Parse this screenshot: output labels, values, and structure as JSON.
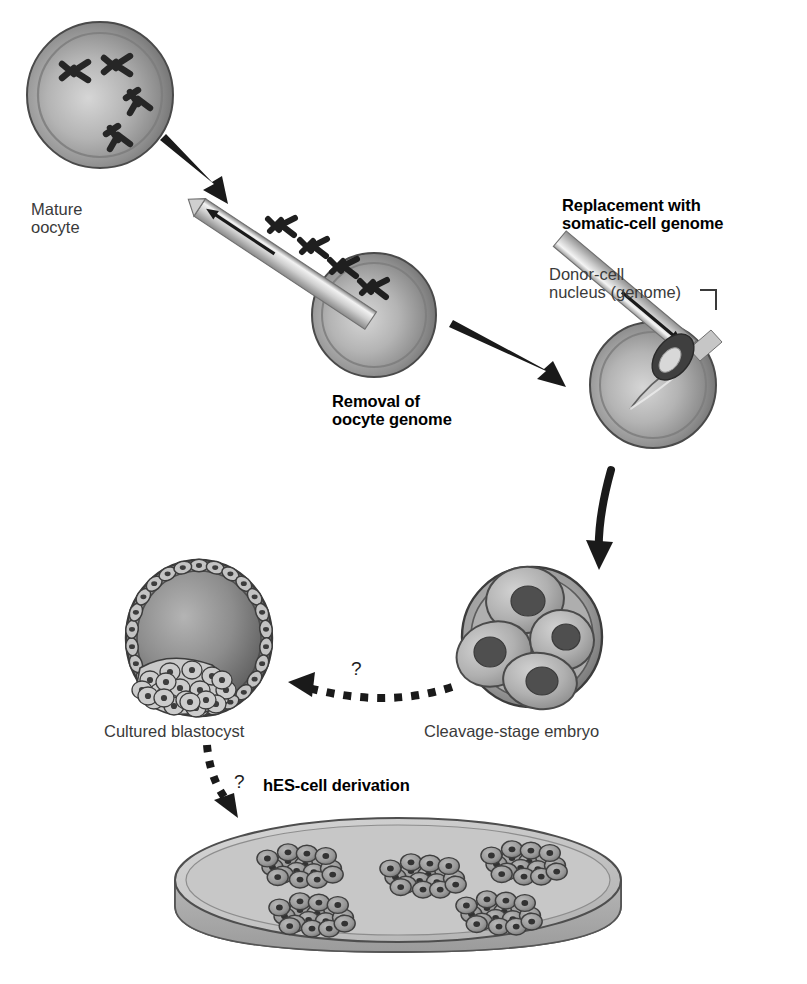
{
  "figure": {
    "type": "scientific-process-diagram",
    "background_color": "#ffffff"
  },
  "palette": {
    "cell_light": "#d8d8d8",
    "cell_mid": "#a9a9a9",
    "cell_dark": "#6f6f6f",
    "outline": "#333333",
    "nucleus_dark": "#4a4a4a",
    "arrow_black": "#1a1a1a",
    "text_gray": "#3a3a3a",
    "text_black": "#000000",
    "dish_fill": "#c9c9c9",
    "dish_rim": "#b2b2b2"
  },
  "labels": {
    "mature_oocyte": "Mature\noocyte",
    "removal_of_oocyte_genome": "Removal of\noocyte genome",
    "replacement_with_somatic_cell_genome": "Replacement with\nsomatic-cell genome",
    "donor_cell_nucleus": "Donor-cell\nnucleus (genome)",
    "cultured_blastocyst": "Cultured blastocyst",
    "cleavage_stage_embryo": "Cleavage-stage embryo",
    "hes_cell_derivation": "hES-cell derivation",
    "question_mark_embryo_to_blastocyst": "?",
    "question_mark_blastocyst_to_dish": "?"
  },
  "stages": [
    {
      "id": "mature-oocyte",
      "name": "Mature oocyte",
      "caption": "Mature\noocyte",
      "caption_bold": false,
      "chromosome_count": 4,
      "cx": 100,
      "cy": 95,
      "r": 73
    },
    {
      "id": "enucleated-oocyte",
      "name": "Oocyte with genome being removed",
      "caption": "Removal of\noocyte genome",
      "caption_bold": true,
      "chromosomes_in_pipette": 4,
      "cx": 374,
      "cy": 315,
      "r": 62
    },
    {
      "id": "reconstructed-oocyte",
      "name": "Oocyte receiving somatic-cell genome",
      "caption": "Replacement with\nsomatic-cell genome",
      "caption_bold": true,
      "annotation": "Donor-cell\nnucleus (genome)",
      "cx": 653,
      "cy": 385,
      "r": 63
    },
    {
      "id": "cleavage-stage-embryo",
      "name": "Cleavage-stage embryo",
      "caption": "Cleavage-stage embryo",
      "caption_bold": false,
      "blastomere_count": 4,
      "cx": 532,
      "cy": 637,
      "r": 70
    },
    {
      "id": "cultured-blastocyst",
      "name": "Cultured blastocyst",
      "caption": "Cultured blastocyst",
      "caption_bold": false,
      "trophoblast_cells": 26,
      "has_inner_cell_mass": true,
      "cx": 199,
      "cy": 638,
      "rx": 73,
      "ry": 78
    },
    {
      "id": "hes-cell-dish",
      "name": "Culture dish with hES-cell colonies",
      "caption": "hES-cell derivation",
      "caption_bold": true,
      "colony_count": 5,
      "cx": 398,
      "cy": 880
    }
  ],
  "arrows": [
    {
      "id": "oocyte-to-removal",
      "style": "solid",
      "from": "mature-oocyte",
      "to": "enucleated-oocyte"
    },
    {
      "id": "removal-to-replacement",
      "style": "solid",
      "from": "enucleated-oocyte",
      "to": "reconstructed-oocyte"
    },
    {
      "id": "replacement-to-embryo",
      "style": "solid-curved",
      "from": "reconstructed-oocyte",
      "to": "cleavage-stage-embryo"
    },
    {
      "id": "embryo-to-blastocyst",
      "style": "dotted",
      "label": "?",
      "from": "cleavage-stage-embryo",
      "to": "cultured-blastocyst"
    },
    {
      "id": "blastocyst-to-dish",
      "style": "dotted",
      "label": "?",
      "from": "cultured-blastocyst",
      "to": "hes-cell-dish"
    },
    {
      "id": "pipette-suction",
      "style": "thin-line",
      "direction": "out-of-oocyte"
    },
    {
      "id": "pipette-injection",
      "style": "thin-line",
      "direction": "into-oocyte"
    }
  ]
}
